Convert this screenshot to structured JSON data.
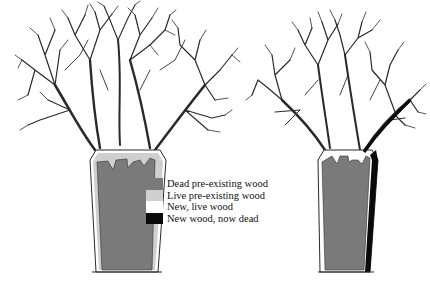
{
  "figure": {
    "trees": [
      {
        "name": "left-tree",
        "trunk": {
          "core": "dead pre-existing wood",
          "rim": "live pre-existing wood with new live wood outer layer"
        }
      },
      {
        "name": "right-tree",
        "trunk": {
          "core": "dead pre-existing wood",
          "left_rim": "live pre-existing/new live wood",
          "right_rim": "new wood, now dead"
        }
      }
    ]
  },
  "legend": {
    "items": [
      {
        "label": "Dead pre-existing wood",
        "color": "#7a7a7a"
      },
      {
        "label": "Live pre-existing wood",
        "color": "#cfcfcf"
      },
      {
        "label": "New, live wood",
        "color": "#ffffff"
      },
      {
        "label": "New wood, now dead",
        "color": "#0a0a0a"
      }
    ]
  },
  "colors": {
    "branch": "#2a2a2a",
    "dead_core": "#7a7a7a",
    "live_old": "#cfcfcf",
    "new_live": "#ffffff",
    "new_dead": "#0a0a0a"
  }
}
